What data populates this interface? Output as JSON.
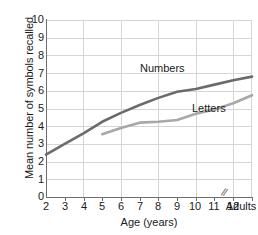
{
  "chart_data": {
    "type": "line",
    "title": "",
    "xlabel": "Age (years)",
    "ylabel": "Mean number of symbols recalled",
    "xlim": [
      2,
      13
    ],
    "ylim": [
      0,
      10
    ],
    "grid": true,
    "legend_position": "inline-annotations",
    "x_tick_labels": [
      "2",
      "3",
      "4",
      "5",
      "6",
      "7",
      "8",
      "9",
      "10",
      "11",
      "12",
      "Adults"
    ],
    "y_tick_labels": [
      "0",
      "1",
      "2",
      "3",
      "4",
      "5",
      "6",
      "7",
      "8",
      "9",
      "10"
    ],
    "axis_break": "//",
    "axis_break_note": "break in x-axis between 12 and Adults",
    "series": [
      {
        "name": "Numbers",
        "color": "#6b6b6b",
        "x": [
          2,
          3,
          4,
          5,
          6,
          7,
          8,
          9,
          10,
          11,
          12,
          13
        ],
        "values": [
          2.4,
          3.0,
          3.6,
          4.25,
          4.75,
          5.2,
          5.6,
          5.95,
          6.1,
          6.35,
          6.6,
          6.8
        ]
      },
      {
        "name": "Letters",
        "color": "#a8a8a8",
        "x": [
          5,
          6,
          7,
          8,
          9,
          10,
          11,
          12,
          13
        ],
        "values": [
          3.55,
          3.9,
          4.2,
          4.25,
          4.35,
          4.7,
          4.95,
          5.3,
          5.75
        ]
      }
    ]
  },
  "labels": {
    "numbers": "Numbers",
    "letters": "Letters",
    "x_axis_title": "Age (years)",
    "y_axis_title": "Mean number of symbols recalled",
    "break_glyph": "//"
  },
  "yticks": {
    "t0": "0",
    "t1": "1",
    "t2": "2",
    "t3": "3",
    "t4": "4",
    "t5": "5",
    "t6": "6",
    "t7": "7",
    "t8": "8",
    "t9": "9",
    "t10": "10"
  },
  "xticks": {
    "t2": "2",
    "t3": "3",
    "t4": "4",
    "t5": "5",
    "t6": "6",
    "t7": "7",
    "t8": "8",
    "t9": "9",
    "t10": "10",
    "t11": "11",
    "t12": "12",
    "tAdults": "Adults"
  },
  "colors": {
    "numbers_line": "#6b6b6b",
    "letters_line": "#a8a8a8",
    "grid": "#d6d6d6",
    "axis": "#6e6e6e",
    "text": "#1a1a1a",
    "background": "#ffffff"
  }
}
